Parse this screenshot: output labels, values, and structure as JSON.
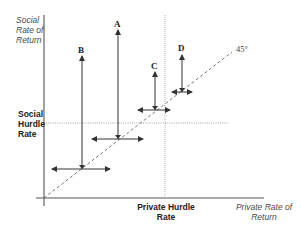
{
  "diagram": {
    "y_axis_label": [
      "Social",
      "Rate of",
      "Return"
    ],
    "x_axis_label": [
      "Private Rate of",
      "Return"
    ],
    "social_hurdle_label": [
      "Social",
      "Hurdle",
      "Rate"
    ],
    "private_hurdle_label": [
      "Private Hurdle",
      "Rate"
    ],
    "diagonal_label": "45°",
    "points": [
      {
        "name": "A",
        "label": "A"
      },
      {
        "name": "B",
        "label": "B"
      },
      {
        "name": "C",
        "label": "C"
      },
      {
        "name": "D",
        "label": "D"
      }
    ],
    "colors": {
      "axis": "#555555",
      "arrow": "#333333",
      "dashed": "#666666",
      "dotted": "#999999"
    }
  }
}
